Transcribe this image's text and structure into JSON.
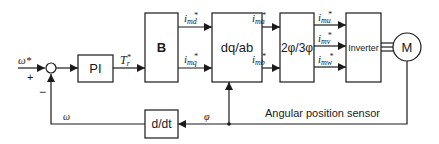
{
  "diagram": {
    "type": "block-diagram",
    "blocks": {
      "pi": {
        "label": "PI"
      },
      "b": {
        "label": "B"
      },
      "dqab": {
        "label": "dq/ab"
      },
      "phase": {
        "label": "2φ/3φ"
      },
      "inverter": {
        "label": "Inverter"
      },
      "motor": {
        "label": "M"
      },
      "ddt": {
        "label": "d/dt"
      }
    },
    "summing_junction": {
      "plus": "+",
      "minus": "−"
    },
    "signals": {
      "speed_ref": "ω*",
      "torque_ref": {
        "base": "T",
        "sub": "r",
        "sup": "*"
      },
      "i_md": {
        "base": "i",
        "sub": "md",
        "sup": "*"
      },
      "i_mq": {
        "base": "i",
        "sub": "mq",
        "sup": "*"
      },
      "i_ma": {
        "base": "i",
        "sub": "ma",
        "sup": "*"
      },
      "i_mb": {
        "base": "i",
        "sub": "mb",
        "sup": "*"
      },
      "i_mu": {
        "base": "i",
        "sub": "mu",
        "sup": "*"
      },
      "i_mv": {
        "base": "i",
        "sub": "mv",
        "sup": "*"
      },
      "i_mw": {
        "base": "i",
        "sub": "mw",
        "sup": "*"
      },
      "omega": "ω",
      "phi": "φ"
    },
    "annotations": {
      "sensor": "Angular position sensor"
    },
    "colors": {
      "line": "#1a1a1a",
      "background": "#ffffff"
    }
  }
}
